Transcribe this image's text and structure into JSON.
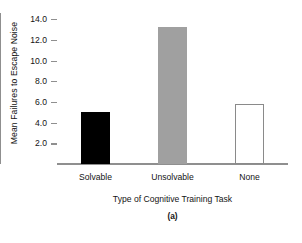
{
  "chart_data": {
    "type": "bar",
    "title": "",
    "subtitle": "(a)",
    "xlabel": "Type of Cognitive Training Task",
    "ylabel": "Mean Failures to Escape Noise",
    "categories": [
      "Solvable",
      "Unsolvable",
      "None"
    ],
    "values": [
      5.0,
      13.2,
      5.8
    ],
    "series": [
      {
        "name": "Mean Failures to Escape Noise",
        "values": [
          5.0,
          13.2,
          5.8
        ]
      }
    ],
    "bar_styles": [
      "filled-black",
      "filled-gray",
      "open-white"
    ],
    "bar_colors": [
      "#000000",
      "#a0a0a0",
      "#ffffff"
    ],
    "bar_edge_color": "#8a8a8a",
    "ylim": [
      0,
      14.6
    ],
    "yticks": [
      2.0,
      4.0,
      6.0,
      8.0,
      10.0,
      12.0,
      14.0
    ],
    "ytick_labels": [
      "2.0",
      "4.0",
      "6.0",
      "8.0",
      "10.0",
      "12.0",
      "14.0"
    ],
    "grid": false,
    "legend": "none",
    "axis_color": "#8f8f8f"
  }
}
